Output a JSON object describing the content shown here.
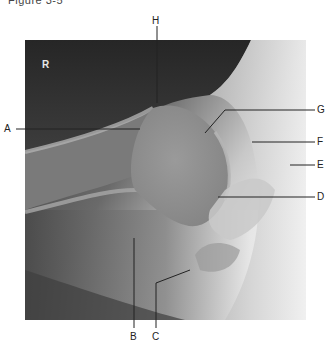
{
  "figure": {
    "caption": "Figure 3-5",
    "side_marker": "R",
    "image_description": "Radiograph of right shoulder (AP view) with labeled anatomical structures"
  },
  "labels": [
    {
      "id": "A",
      "text": "A"
    },
    {
      "id": "B",
      "text": "B"
    },
    {
      "id": "C",
      "text": "C"
    },
    {
      "id": "D",
      "text": "D"
    },
    {
      "id": "E",
      "text": "E"
    },
    {
      "id": "F",
      "text": "F"
    },
    {
      "id": "G",
      "text": "G"
    },
    {
      "id": "H",
      "text": "H"
    }
  ],
  "colors": {
    "background": "#ffffff",
    "leader_line": "#222222",
    "label_text": "#222222",
    "xray_dark": "#2a2a2a",
    "xray_light": "#f2f2f2"
  }
}
